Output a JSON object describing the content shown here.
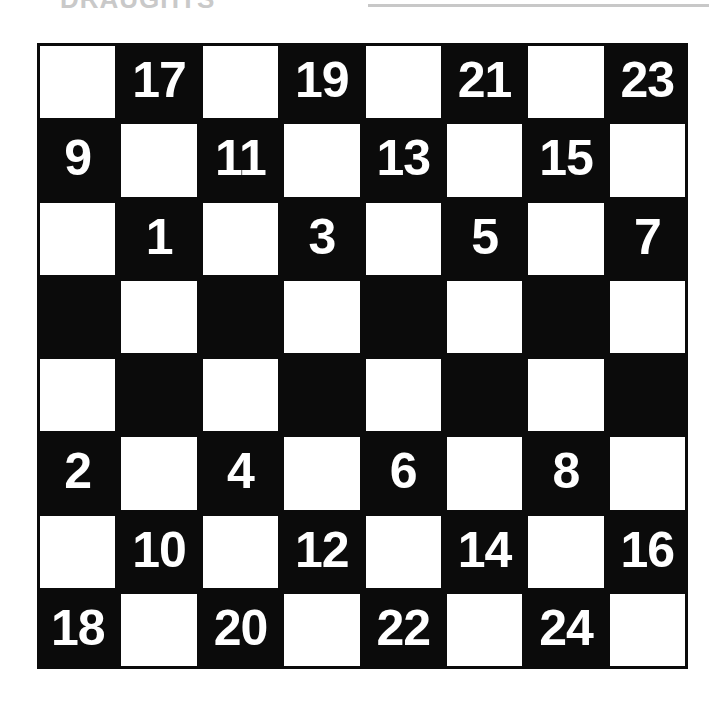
{
  "scan_header": {
    "cut_off_heading": "DRAUGHTS",
    "rule": "horizontal-rule"
  },
  "board": {
    "name": "draughts-board-diagram",
    "rows": 8,
    "columns": 8,
    "light_color": "#ffffff",
    "dark_color": "#0b0b0b",
    "number_color": "#ffffff",
    "cells": [
      [
        {
          "shade": "light",
          "label": ""
        },
        {
          "shade": "dark",
          "label": "17"
        },
        {
          "shade": "light",
          "label": ""
        },
        {
          "shade": "dark",
          "label": "19"
        },
        {
          "shade": "light",
          "label": ""
        },
        {
          "shade": "dark",
          "label": "21"
        },
        {
          "shade": "light",
          "label": ""
        },
        {
          "shade": "dark",
          "label": "23"
        }
      ],
      [
        {
          "shade": "dark",
          "label": "9"
        },
        {
          "shade": "light",
          "label": ""
        },
        {
          "shade": "dark",
          "label": "11"
        },
        {
          "shade": "light",
          "label": ""
        },
        {
          "shade": "dark",
          "label": "13"
        },
        {
          "shade": "light",
          "label": ""
        },
        {
          "shade": "dark",
          "label": "15"
        },
        {
          "shade": "light",
          "label": ""
        }
      ],
      [
        {
          "shade": "light",
          "label": ""
        },
        {
          "shade": "dark",
          "label": "1"
        },
        {
          "shade": "light",
          "label": ""
        },
        {
          "shade": "dark",
          "label": "3"
        },
        {
          "shade": "light",
          "label": ""
        },
        {
          "shade": "dark",
          "label": "5"
        },
        {
          "shade": "light",
          "label": ""
        },
        {
          "shade": "dark",
          "label": "7"
        }
      ],
      [
        {
          "shade": "dark",
          "label": ""
        },
        {
          "shade": "light",
          "label": ""
        },
        {
          "shade": "dark",
          "label": ""
        },
        {
          "shade": "light",
          "label": ""
        },
        {
          "shade": "dark",
          "label": ""
        },
        {
          "shade": "light",
          "label": ""
        },
        {
          "shade": "dark",
          "label": ""
        },
        {
          "shade": "light",
          "label": ""
        }
      ],
      [
        {
          "shade": "light",
          "label": ""
        },
        {
          "shade": "dark",
          "label": ""
        },
        {
          "shade": "light",
          "label": ""
        },
        {
          "shade": "dark",
          "label": ""
        },
        {
          "shade": "light",
          "label": ""
        },
        {
          "shade": "dark",
          "label": ""
        },
        {
          "shade": "light",
          "label": ""
        },
        {
          "shade": "dark",
          "label": ""
        }
      ],
      [
        {
          "shade": "dark",
          "label": "2"
        },
        {
          "shade": "light",
          "label": ""
        },
        {
          "shade": "dark",
          "label": "4"
        },
        {
          "shade": "light",
          "label": ""
        },
        {
          "shade": "dark",
          "label": "6"
        },
        {
          "shade": "light",
          "label": ""
        },
        {
          "shade": "dark",
          "label": "8"
        },
        {
          "shade": "light",
          "label": ""
        }
      ],
      [
        {
          "shade": "light",
          "label": ""
        },
        {
          "shade": "dark",
          "label": "10"
        },
        {
          "shade": "light",
          "label": ""
        },
        {
          "shade": "dark",
          "label": "12"
        },
        {
          "shade": "light",
          "label": ""
        },
        {
          "shade": "dark",
          "label": "14"
        },
        {
          "shade": "light",
          "label": ""
        },
        {
          "shade": "dark",
          "label": "16"
        }
      ],
      [
        {
          "shade": "dark",
          "label": "18"
        },
        {
          "shade": "light",
          "label": ""
        },
        {
          "shade": "dark",
          "label": "20"
        },
        {
          "shade": "light",
          "label": ""
        },
        {
          "shade": "dark",
          "label": "22"
        },
        {
          "shade": "light",
          "label": ""
        },
        {
          "shade": "dark",
          "label": "24"
        },
        {
          "shade": "light",
          "label": ""
        }
      ]
    ]
  }
}
